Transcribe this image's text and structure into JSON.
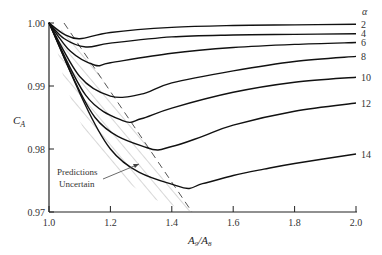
{
  "chart_data": {
    "type": "line",
    "title": "",
    "xlabel": "A9/A8",
    "ylabel": "C_A",
    "legend_title": "α",
    "xlim": [
      1.0,
      2.0
    ],
    "ylim": [
      0.97,
      1.0
    ],
    "x_ticks": [
      "1.0",
      "1.2",
      "1.4",
      "1.6",
      "1.8",
      "2.0"
    ],
    "y_ticks": [
      "1.00",
      "0.99",
      "0.98",
      "0.97"
    ],
    "grid": false,
    "series": [
      {
        "name": "2",
        "x": [
          1.0,
          1.05,
          1.1,
          1.2,
          1.4,
          1.6,
          1.8,
          2.0
        ],
        "values": [
          1.0,
          0.9982,
          0.9975,
          0.9985,
          0.9993,
          0.9996,
          0.9997,
          0.9998
        ]
      },
      {
        "name": "4",
        "x": [
          1.0,
          1.05,
          1.12,
          1.2,
          1.4,
          1.6,
          1.8,
          2.0
        ],
        "values": [
          1.0,
          0.9975,
          0.9962,
          0.9968,
          0.9978,
          0.9981,
          0.9982,
          0.9983
        ]
      },
      {
        "name": "6",
        "x": [
          1.0,
          1.07,
          1.15,
          1.2,
          1.4,
          1.6,
          1.8,
          2.0
        ],
        "values": [
          1.0,
          0.9955,
          0.9933,
          0.9937,
          0.9952,
          0.9961,
          0.9966,
          0.9969
        ]
      },
      {
        "name": "8",
        "x": [
          1.0,
          1.1,
          1.2,
          1.3,
          1.4,
          1.6,
          1.8,
          2.0
        ],
        "values": [
          1.0,
          0.9915,
          0.9884,
          0.9887,
          0.9905,
          0.9924,
          0.9939,
          0.9947
        ]
      },
      {
        "name": "10",
        "x": [
          1.0,
          1.12,
          1.24,
          1.3,
          1.4,
          1.6,
          1.8,
          2.0
        ],
        "values": [
          1.0,
          0.9885,
          0.9845,
          0.9848,
          0.9865,
          0.989,
          0.9906,
          0.9914
        ]
      },
      {
        "name": "12",
        "x": [
          1.0,
          1.15,
          1.32,
          1.4,
          1.5,
          1.6,
          1.8,
          2.0
        ],
        "values": [
          1.0,
          0.985,
          0.9802,
          0.9804,
          0.982,
          0.9838,
          0.986,
          0.9873
        ]
      },
      {
        "name": "14",
        "x": [
          1.0,
          1.2,
          1.42,
          1.5,
          1.6,
          1.7,
          1.8,
          2.0
        ],
        "values": [
          1.0,
          0.98,
          0.9741,
          0.9745,
          0.9758,
          0.9768,
          0.9777,
          0.9792
        ]
      }
    ],
    "annotations": [
      {
        "text": "Predictions Uncertain",
        "region": "hatched band left of dashed boundary from (1.05, 1.00) to (1.47, 0.97)"
      }
    ]
  },
  "labels": {
    "xlabel_main": "A",
    "xlabel_sub9": "9",
    "xlabel_slash": "/A",
    "xlabel_sub8": "8",
    "ylabel_main": "C",
    "ylabel_sub": "A",
    "legend_title": "α",
    "annot_line1": "Predictions",
    "annot_line2": "Uncertain"
  }
}
